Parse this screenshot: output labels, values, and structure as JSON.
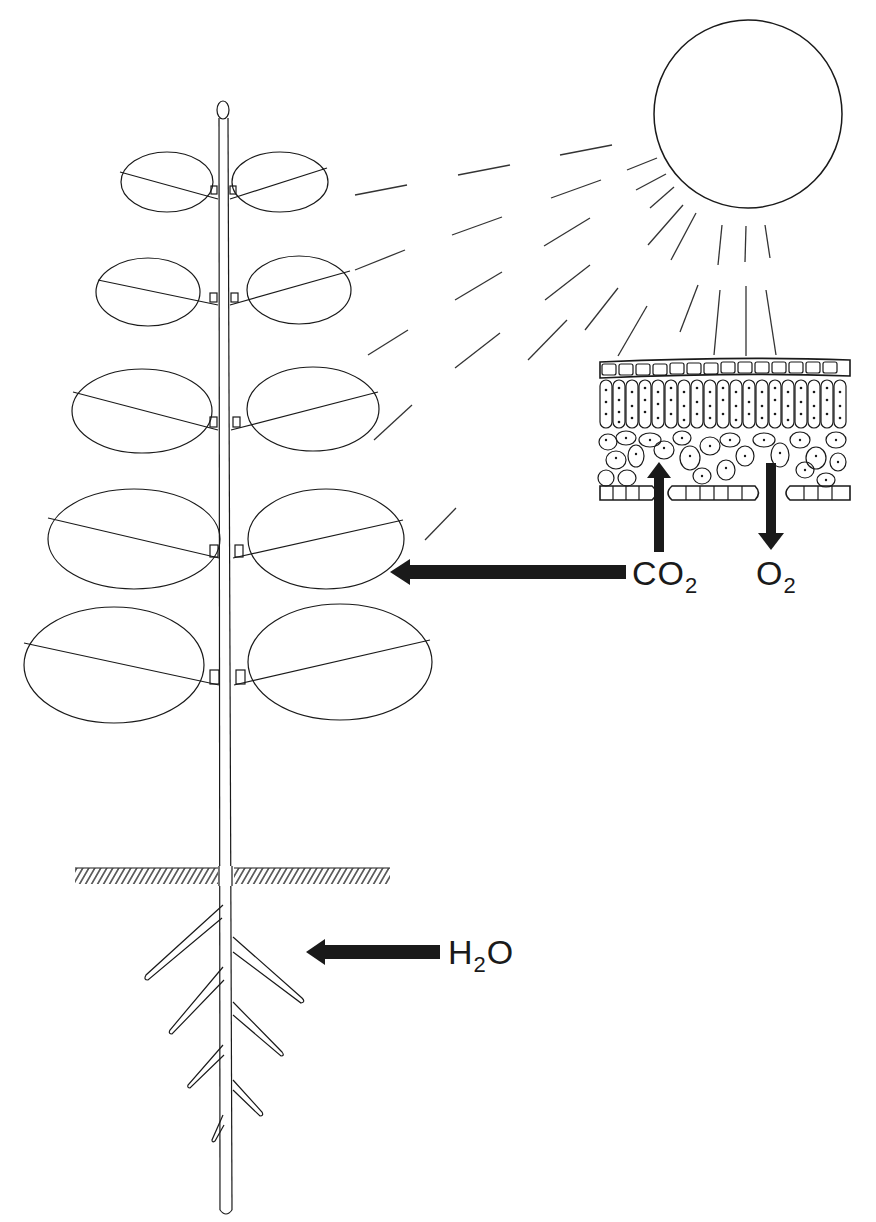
{
  "figure": {
    "title": "",
    "colors": {
      "line": "#1a1a1a",
      "arrow": "#1a1a1a",
      "background": "#ffffff"
    }
  },
  "labels": {
    "co2": {
      "main": "CO",
      "sub": "2"
    },
    "o2": {
      "main": "O",
      "sub": "2"
    },
    "h2o": {
      "pre": "H",
      "sub": "2",
      "post": "O"
    }
  },
  "components": {
    "sun": {
      "name": "sun"
    },
    "plant": {
      "leaf_pairs": 5,
      "root_branches": 8
    },
    "leaf_section": {
      "layers": [
        "upper epidermis",
        "palisade mesophyll",
        "spongy mesophyll",
        "lower epidermis with stomata"
      ]
    },
    "arrows": [
      {
        "id": "co2-into-leaf",
        "label": "CO2",
        "direction": "up"
      },
      {
        "id": "o2-out-of-leaf",
        "label": "O2",
        "direction": "down"
      },
      {
        "id": "co2-to-plant",
        "label": "CO2",
        "direction": "left"
      },
      {
        "id": "h2o-to-roots",
        "label": "H2O",
        "direction": "left"
      }
    ]
  }
}
